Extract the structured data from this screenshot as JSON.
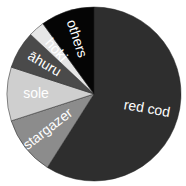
{
  "chart_data": {
    "type": "pie",
    "title": "",
    "categories": [
      "red cod",
      "stargazer",
      "sole",
      "āhuru",
      "hoki",
      "others"
    ],
    "values": [
      59,
      11,
      10,
      7,
      3,
      10
    ],
    "colors": [
      "#2e2e2e",
      "#8c8c8c",
      "#cfcfcf",
      "#4a4a4a",
      "#e6e6e6",
      "#050505"
    ],
    "label_colors": [
      "#ffffff",
      "#ffffff",
      "#ffffff",
      "#ffffff",
      "#ffffff",
      "#ffffff"
    ],
    "start_angle_deg": 0,
    "direction": "clockwise",
    "legend": "none"
  }
}
